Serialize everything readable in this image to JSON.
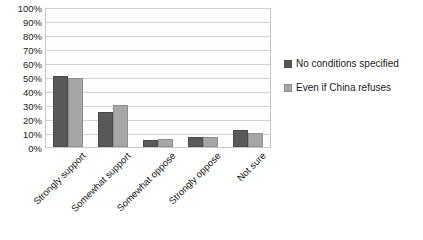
{
  "chart_data": {
    "type": "bar",
    "title": "",
    "xlabel": "",
    "ylabel": "",
    "ylim": [
      0,
      100
    ],
    "yticks": [
      "100%",
      "90%",
      "80%",
      "70%",
      "60%",
      "50%",
      "40%",
      "30%",
      "20%",
      "10%",
      "0%"
    ],
    "ytick_values": [
      100,
      90,
      80,
      70,
      60,
      50,
      40,
      30,
      20,
      10,
      0
    ],
    "grid": true,
    "legend_position": "right",
    "categories": [
      "Strongly support",
      "Somewhat support",
      "Somewhat oppose",
      "Strongly oppose",
      "Not sure"
    ],
    "series": [
      {
        "name": "No conditions specified",
        "color": "#595959",
        "values": [
          51,
          25,
          5,
          7,
          12
        ]
      },
      {
        "name": "Even if China refuses",
        "color": "#a6a6a6",
        "values": [
          49,
          30,
          6,
          7,
          10
        ]
      }
    ]
  }
}
